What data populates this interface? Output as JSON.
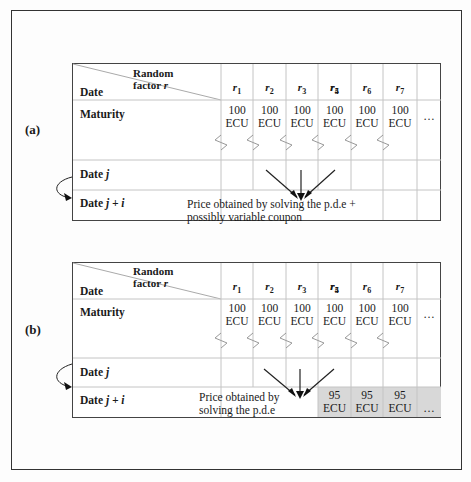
{
  "panels": [
    {
      "label": "(a)",
      "header": {
        "corner_top": "Random",
        "corner_top2": "factor",
        "corner_var": "r",
        "corner_bottom": "Date",
        "factors": [
          "r1",
          "r2",
          "r3",
          "r4",
          "r5",
          "r6",
          "r7",
          "..."
        ]
      },
      "rows": {
        "maturity": "Maturity",
        "date_j_prefix": "Date",
        "date_j_var": "j",
        "date_ji_prefix": "Date",
        "date_ji_var": "j + i"
      },
      "maturity_values": [
        "100 ECU",
        "100 ECU",
        "100 ECU",
        "100 ECU",
        "100 ECU",
        "100 ECU",
        "100 ECU",
        "..."
      ],
      "note_line1": "Price obtained by solving the p.d.e +",
      "note_line2": "possibly variable coupon"
    },
    {
      "label": "(b)",
      "header": {
        "corner_top": "Random",
        "corner_top2": "factor",
        "corner_var": "r",
        "corner_bottom": "Date",
        "factors": [
          "r1",
          "r2",
          "r3",
          "r4",
          "r5",
          "r6",
          "r7",
          "..."
        ]
      },
      "rows": {
        "maturity": "Maturity",
        "date_j_prefix": "Date",
        "date_j_var": "j",
        "date_ji_prefix": "Date",
        "date_ji_var": "j + i"
      },
      "maturity_values": [
        "100 ECU",
        "100 ECU",
        "100 ECU",
        "100 ECU",
        "100 ECU",
        "100 ECU",
        "100 ECU",
        "..."
      ],
      "note_line1": "Price obtained by",
      "note_line2": "solving the p.d.e",
      "shaded_values": [
        "95 ECU",
        "95 ECU",
        "95 ECU",
        "..."
      ],
      "shaded_color": "#d8d8d8"
    }
  ]
}
